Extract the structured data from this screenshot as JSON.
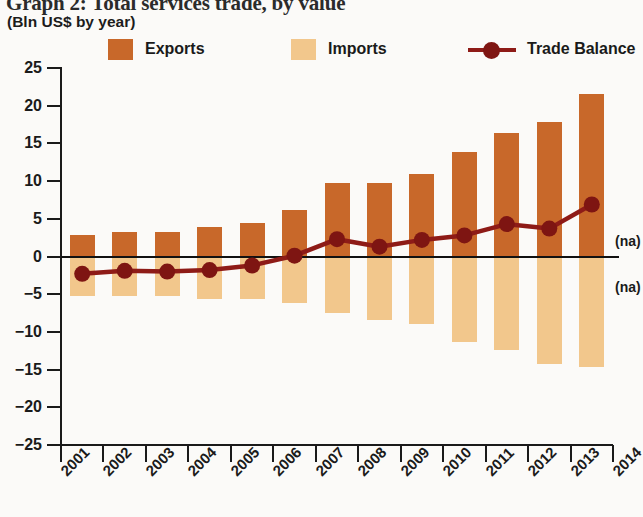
{
  "header": {
    "title": "Graph 2: Total services trade, by value",
    "subtitle": "(Bln US$ by year)"
  },
  "legend": {
    "position": "top",
    "items": [
      {
        "label": "Exports",
        "color": "#C8682A",
        "marker": "swatch"
      },
      {
        "label": "Imports",
        "color": "#F2C78C",
        "marker": "swatch"
      },
      {
        "label": "Trade Balance",
        "color": "#8E1B17",
        "marker": "line-dot"
      }
    ]
  },
  "annotations": [
    {
      "text": "(na)",
      "x_category": "2014",
      "y_value": 2.0
    },
    {
      "text": "(na)",
      "x_category": "2014",
      "y_value": -4.0
    }
  ],
  "colors": {
    "exports": "#C8682A",
    "imports": "#F2C78C",
    "balance": "#8E1B17",
    "axis": "#1a1a1a",
    "background": "#fbfaf8"
  },
  "chart_data": {
    "type": "bar",
    "title": "Graph 2: Total services trade, by value",
    "subtitle": "(Bln US$ by year)",
    "xlabel": "",
    "ylabel": "(Bln US$ by year)",
    "categories": [
      "2001",
      "2002",
      "2003",
      "2004",
      "2005",
      "2006",
      "2007",
      "2008",
      "2009",
      "2010",
      "2011",
      "2012",
      "2013",
      "2014"
    ],
    "ylim": [
      -25,
      25
    ],
    "yticks": [
      25,
      20,
      15,
      10,
      5,
      0,
      -5,
      -10,
      -15,
      -20,
      -25
    ],
    "ytick_labels": [
      "25",
      "20",
      "15",
      "10",
      "5",
      "0",
      "−5",
      "−10",
      "−15",
      "−20",
      "−25"
    ],
    "grid": false,
    "legend_position": "top",
    "series": [
      {
        "name": "Exports",
        "type": "bar",
        "color": "#C8682A",
        "values": [
          2.9,
          3.2,
          3.3,
          3.9,
          4.4,
          6.2,
          9.8,
          9.8,
          10.9,
          13.9,
          16.4,
          17.9,
          21.5,
          null
        ]
      },
      {
        "name": "Imports",
        "type": "bar",
        "color": "#F2C78C",
        "values": [
          -5.2,
          -5.3,
          -5.3,
          -5.6,
          -5.6,
          -6.2,
          -7.5,
          -8.4,
          -9.0,
          -11.4,
          -12.4,
          -14.3,
          -14.6,
          null
        ]
      },
      {
        "name": "Trade Balance",
        "type": "line",
        "color": "#8E1B17",
        "values": [
          -2.3,
          -1.9,
          -2.0,
          -1.8,
          -1.2,
          0.1,
          2.3,
          1.3,
          2.2,
          2.8,
          4.3,
          3.7,
          6.9,
          null
        ]
      }
    ]
  }
}
